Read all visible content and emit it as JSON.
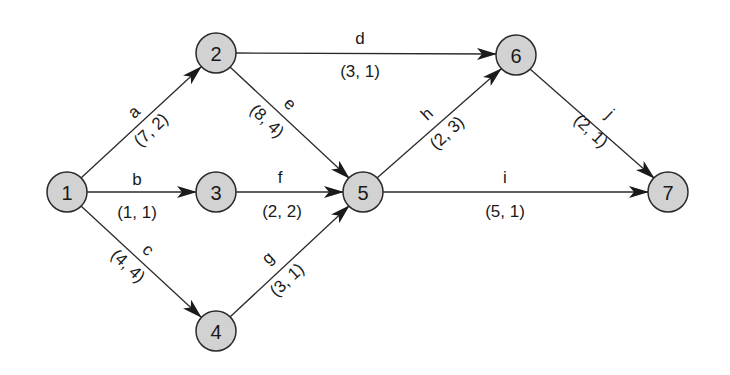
{
  "diagram": {
    "type": "activity-network",
    "node_color": "#d2d2d2",
    "stroke_color": "#2a2a2a",
    "nodes": [
      {
        "id": "1",
        "label": "1",
        "x": 67,
        "y": 192
      },
      {
        "id": "2",
        "label": "2",
        "x": 216,
        "y": 53
      },
      {
        "id": "3",
        "label": "3",
        "x": 216,
        "y": 192
      },
      {
        "id": "4",
        "label": "4",
        "x": 216,
        "y": 331
      },
      {
        "id": "5",
        "label": "5",
        "x": 363,
        "y": 192
      },
      {
        "id": "6",
        "label": "6",
        "x": 516,
        "y": 55
      },
      {
        "id": "7",
        "label": "7",
        "x": 668,
        "y": 192
      }
    ],
    "edges": [
      {
        "name": "a",
        "weight": "(7, 2)",
        "from": "1",
        "to": "2"
      },
      {
        "name": "b",
        "weight": "(1, 1)",
        "from": "1",
        "to": "3"
      },
      {
        "name": "c",
        "weight": "(4, 4)",
        "from": "1",
        "to": "4"
      },
      {
        "name": "d",
        "weight": "(3, 1)",
        "from": "2",
        "to": "6"
      },
      {
        "name": "e",
        "weight": "(8, 4)",
        "from": "2",
        "to": "5"
      },
      {
        "name": "f",
        "weight": "(2, 2)",
        "from": "3",
        "to": "5"
      },
      {
        "name": "g",
        "weight": "(3, 1)",
        "from": "4",
        "to": "5"
      },
      {
        "name": "h",
        "weight": "(2, 3)",
        "from": "5",
        "to": "6"
      },
      {
        "name": "i",
        "weight": "(5, 1)",
        "from": "5",
        "to": "7"
      },
      {
        "name": "j",
        "weight": "(2, 1)",
        "from": "6",
        "to": "7"
      }
    ]
  }
}
